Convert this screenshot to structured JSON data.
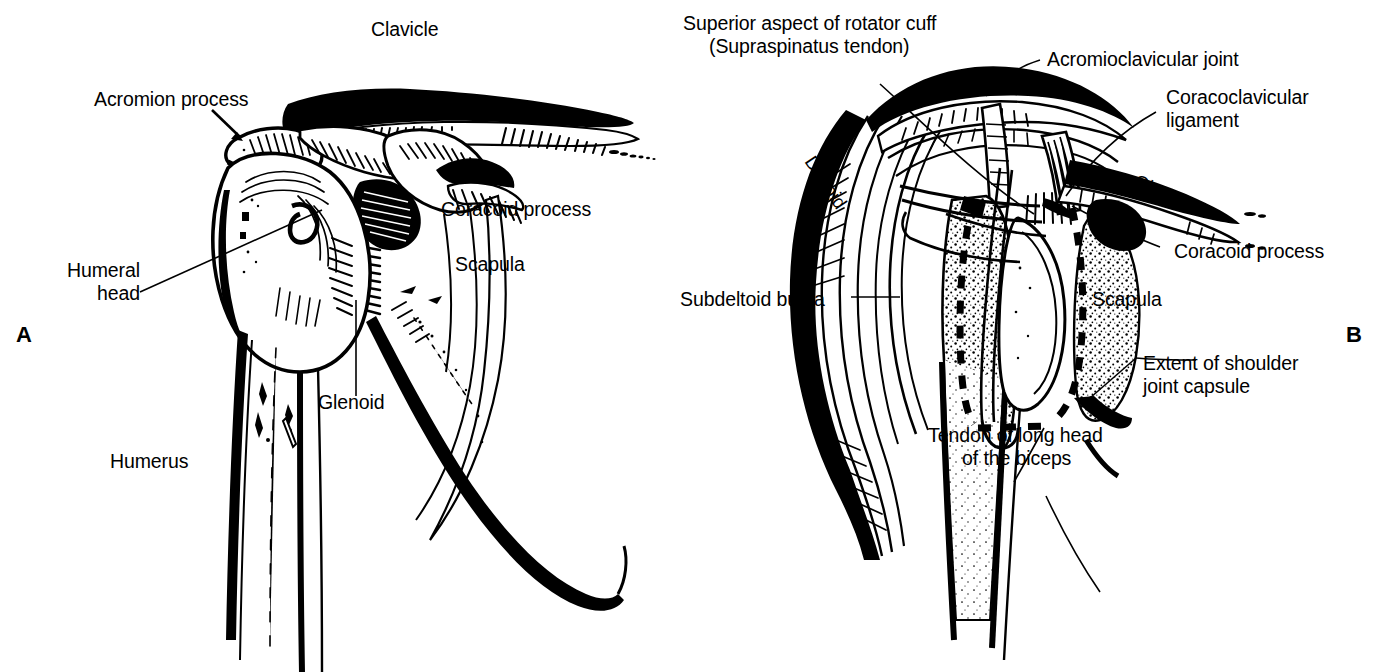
{
  "figure": {
    "background_color": "#ffffff",
    "ink_color": "#000000",
    "panels": [
      {
        "letter": "A",
        "caption": "Bony anatomy of the shoulder"
      },
      {
        "letter": "B",
        "caption": "Coronal section of the shoulder joint"
      }
    ]
  },
  "panel_a": {
    "letter": "A",
    "labels": {
      "clavicle": "Clavicle",
      "acromion_process": "Acromion process",
      "coracoid_process": "Coracoid process",
      "scapula": "Scapula",
      "humeral_head_line1": "Humeral",
      "humeral_head_line2": "head",
      "glenoid": "Glenoid",
      "humerus": "Humerus"
    }
  },
  "panel_b": {
    "letter": "B",
    "labels": {
      "rotator_cuff_line1": "Superior aspect of rotator cuff",
      "rotator_cuff_line2": "(Supraspinatus tendon)",
      "acromioclavicular_joint": "Acromioclavicular joint",
      "coracoclavicular_line1": "Coracoclavicular",
      "coracoclavicular_line2": "ligament",
      "clavicle": "Clavicle",
      "coracoid_process": "Coracoid process",
      "scapula": "Scapula",
      "subdeltoid_bursa": "Subdeltoid bursa",
      "deltoid": "Deltoid",
      "extent_capsule_line1": "Extent of shoulder",
      "extent_capsule_line2": "joint capsule",
      "biceps_tendon_line1": "Tendon of long head",
      "biceps_tendon_line2": "of the biceps"
    }
  }
}
